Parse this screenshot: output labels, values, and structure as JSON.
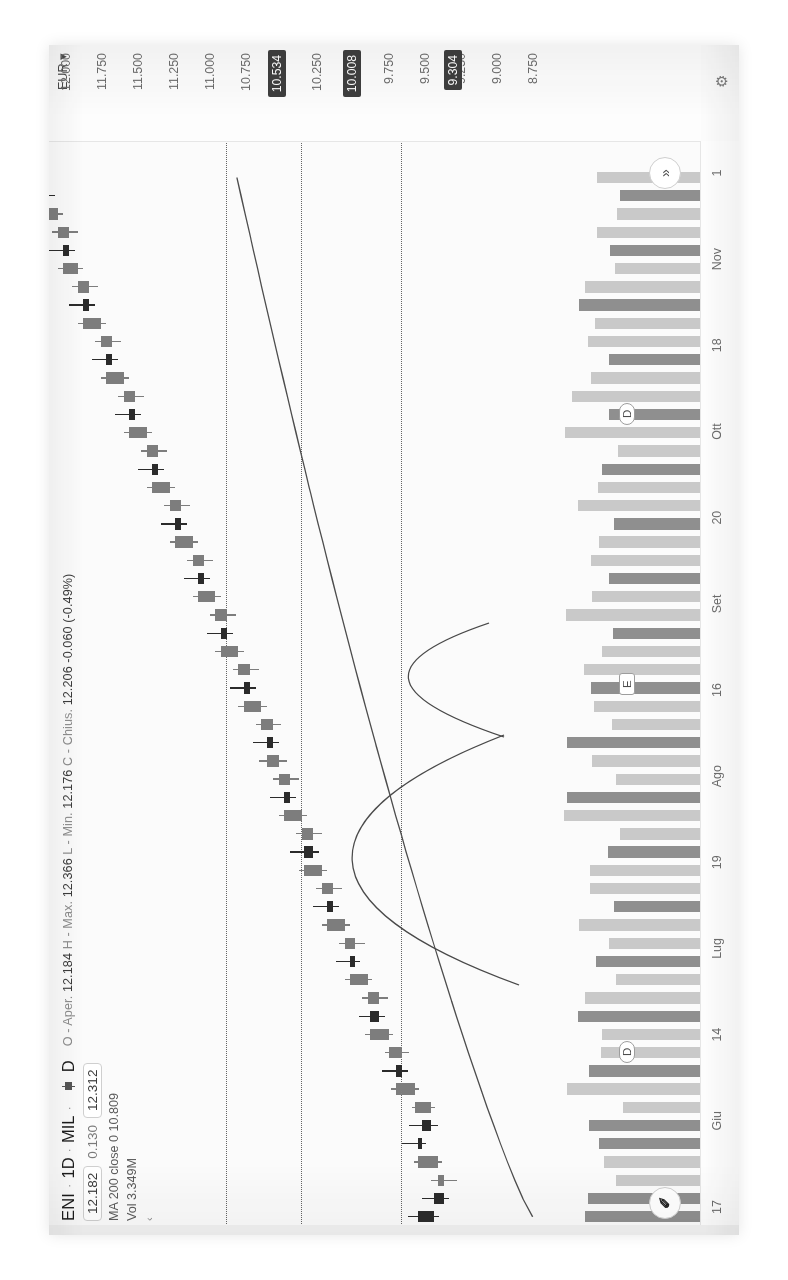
{
  "app": {
    "name": "tradingview-chart",
    "locale": "it"
  },
  "header": {
    "symbol": "ENI",
    "separator": "·",
    "timeframe": "1D",
    "exchange": "MIL",
    "chart_style_icon": "candlestick-icon",
    "chart_style_label": "D",
    "ohlc": {
      "o_label": "O - Aper.",
      "o_value": "12.184",
      "h_label": "H - Max.",
      "h_value": "12.366",
      "l_label": "L - Min.",
      "l_value": "12.176",
      "c_label": "C - Chius.",
      "c_value": "12.206",
      "change_abs": "-0.060",
      "change_pct": "(-0.49%)"
    },
    "quote": {
      "bid": "12.182",
      "spread": "0.130",
      "ask": "12.312"
    },
    "indicator_ma": "MA 200 close 0  10.809",
    "indicator_vol": "Vol  3.349M",
    "collapse_icon": "chevron-left-icon"
  },
  "price_scale": {
    "currency": "EUR",
    "currency_caret": "▾",
    "settings_icon": "gear-icon",
    "ticks": [
      "12.000",
      "11.750",
      "11.500",
      "11.250",
      "11.000",
      "10.750",
      "10.250",
      "9.750",
      "9.500",
      "9.250",
      "9.000",
      "8.750"
    ],
    "badges": [
      "10.534",
      "10.008",
      "9.304"
    ]
  },
  "time_scale": {
    "ticks": [
      "17",
      "Giu",
      "14",
      "Lug",
      "19",
      "Ago",
      "16",
      "Set",
      "20",
      "Ott",
      "18",
      "Nov",
      "1"
    ]
  },
  "chips": [
    {
      "name": "dividend-marker-1",
      "label": "D"
    },
    {
      "name": "earnings-marker",
      "label": "E"
    },
    {
      "name": "dividend-marker-2",
      "label": "D"
    }
  ],
  "buttons": {
    "tv_logo": "✐",
    "scroll_to_realtime": "»"
  },
  "colors": {
    "up": "#7d7d7d",
    "down": "#2b2b2b",
    "vol_up": "#c9c9c9",
    "vol_down": "#8f8f8f",
    "badge_bg": "#3e3e3e",
    "change_negative": "#d1403c",
    "background": "#fbfbfb",
    "grid_line": "#4a4a4a"
  },
  "chart_data": {
    "type": "line",
    "subtype": "candlestick-with-volume",
    "title": "ENI · 1D · MIL",
    "xlabel": "",
    "ylabel": "EUR",
    "ylim": [
      8.65,
      12.12
    ],
    "grid": "horizontal-dotted",
    "legend": "top-left",
    "x_tick_labels": [
      "17",
      "Giu",
      "14",
      "Lug",
      "19",
      "Ago",
      "16",
      "Set",
      "20",
      "Ott",
      "18",
      "Nov",
      "1"
    ],
    "y_tick_labels": [
      "12.000",
      "11.750",
      "11.500",
      "11.250",
      "11.000",
      "10.750",
      "10.250",
      "9.750",
      "9.500",
      "9.250",
      "9.000",
      "8.750"
    ],
    "horizontal_lines": [
      10.534,
      10.008,
      9.304
    ],
    "annotations": [
      {
        "type": "price-badge",
        "value": "10.534"
      },
      {
        "type": "price-badge",
        "value": "10.008"
      },
      {
        "type": "price-badge",
        "value": "9.304"
      },
      {
        "type": "event-marker",
        "label": "D",
        "x_approx": "Giu"
      },
      {
        "type": "event-marker",
        "label": "E",
        "x_approx": "Ago"
      },
      {
        "type": "event-marker",
        "label": "D",
        "x_approx": "Ott"
      }
    ],
    "series": [
      {
        "name": "ENI OHLC",
        "type": "candlestick",
        "ohlc": [
          [
            9.55,
            9.62,
            9.4,
            9.44
          ],
          [
            9.44,
            9.52,
            9.33,
            9.37
          ],
          [
            9.37,
            9.46,
            9.28,
            9.41
          ],
          [
            9.41,
            9.58,
            9.38,
            9.55
          ],
          [
            9.55,
            9.66,
            9.49,
            9.52
          ],
          [
            9.52,
            9.61,
            9.41,
            9.46
          ],
          [
            9.46,
            9.59,
            9.43,
            9.57
          ],
          [
            9.57,
            9.74,
            9.54,
            9.7
          ],
          [
            9.7,
            9.8,
            9.62,
            9.66
          ],
          [
            9.66,
            9.78,
            9.61,
            9.75
          ],
          [
            9.75,
            9.92,
            9.72,
            9.88
          ],
          [
            9.88,
            9.96,
            9.78,
            9.82
          ],
          [
            9.82,
            9.94,
            9.76,
            9.9
          ],
          [
            9.9,
            10.06,
            9.87,
            10.02
          ],
          [
            10.02,
            10.12,
            9.95,
            9.99
          ],
          [
            9.99,
            10.1,
            9.92,
            10.06
          ],
          [
            10.06,
            10.22,
            10.02,
            10.18
          ],
          [
            10.18,
            10.28,
            10.1,
            10.14
          ],
          [
            10.14,
            10.26,
            10.08,
            10.22
          ],
          [
            10.22,
            10.38,
            10.18,
            10.34
          ],
          [
            10.34,
            10.44,
            10.24,
            10.28
          ],
          [
            10.28,
            10.4,
            10.22,
            10.36
          ],
          [
            10.36,
            10.52,
            10.32,
            10.48
          ],
          [
            10.48,
            10.58,
            10.4,
            10.44
          ],
          [
            10.44,
            10.56,
            10.38,
            10.52
          ],
          [
            10.52,
            10.66,
            10.46,
            10.6
          ],
          [
            10.6,
            10.7,
            10.52,
            10.56
          ],
          [
            10.56,
            10.68,
            10.5,
            10.64
          ],
          [
            10.64,
            10.8,
            10.6,
            10.76
          ],
          [
            10.76,
            10.86,
            10.68,
            10.72
          ],
          [
            10.72,
            10.84,
            10.66,
            10.8
          ],
          [
            10.8,
            10.96,
            10.76,
            10.92
          ],
          [
            10.92,
            11.02,
            10.84,
            10.88
          ],
          [
            10.88,
            11.0,
            10.82,
            10.96
          ],
          [
            10.96,
            11.12,
            10.92,
            11.08
          ],
          [
            11.08,
            11.18,
            11.0,
            11.04
          ],
          [
            11.04,
            11.16,
            10.98,
            11.12
          ],
          [
            11.12,
            11.28,
            11.08,
            11.24
          ],
          [
            11.24,
            11.34,
            11.16,
            11.2
          ],
          [
            11.2,
            11.32,
            11.14,
            11.28
          ],
          [
            11.28,
            11.44,
            11.24,
            11.4
          ],
          [
            11.4,
            11.5,
            11.32,
            11.36
          ],
          [
            11.36,
            11.48,
            11.3,
            11.44
          ],
          [
            11.44,
            11.6,
            11.4,
            11.56
          ],
          [
            11.56,
            11.66,
            11.48,
            11.52
          ],
          [
            11.52,
            11.64,
            11.46,
            11.6
          ],
          [
            11.6,
            11.76,
            11.56,
            11.72
          ],
          [
            11.72,
            11.82,
            11.64,
            11.68
          ],
          [
            11.68,
            11.8,
            11.62,
            11.76
          ],
          [
            11.76,
            11.92,
            11.72,
            11.88
          ],
          [
            11.88,
            11.98,
            11.8,
            11.84
          ],
          [
            11.84,
            11.96,
            11.78,
            11.92
          ],
          [
            11.92,
            12.06,
            11.88,
            12.02
          ],
          [
            12.02,
            12.12,
            11.94,
            11.98
          ],
          [
            11.98,
            12.1,
            11.92,
            12.06
          ],
          [
            12.06,
            12.2,
            12.02,
            12.16
          ],
          [
            12.16,
            12.26,
            12.08,
            12.12
          ],
          [
            12.184,
            12.366,
            12.176,
            12.206
          ]
        ]
      },
      {
        "name": "MA 200 close 0",
        "type": "line",
        "last_value": 10.809
      },
      {
        "name": "Vol",
        "type": "volume",
        "last_value": "3.349M"
      }
    ]
  }
}
